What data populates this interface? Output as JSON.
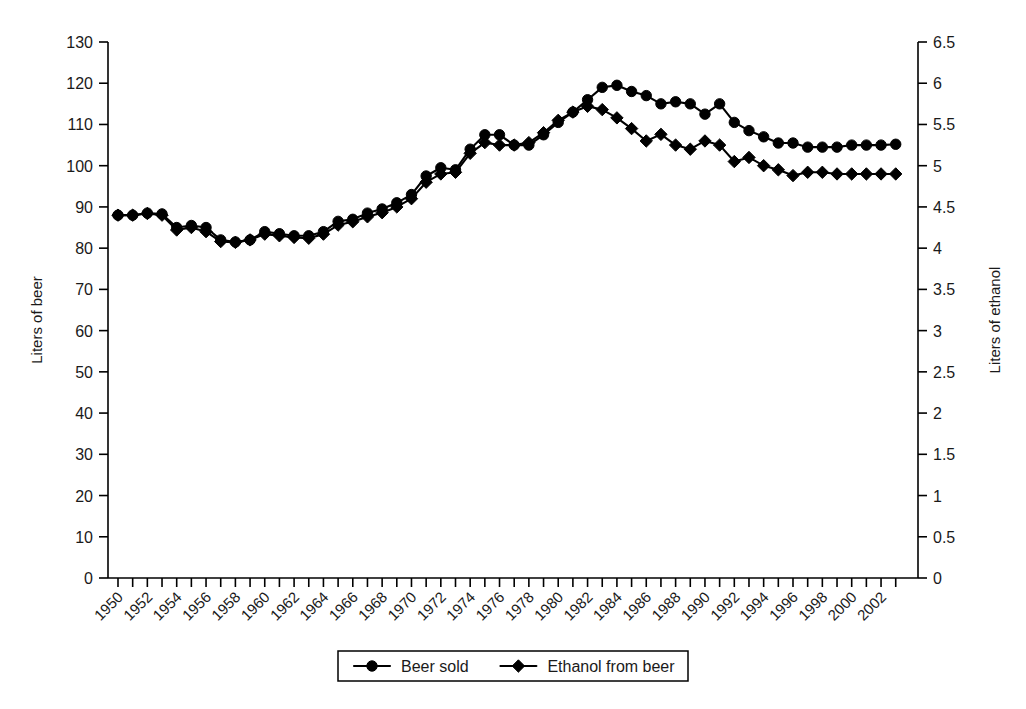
{
  "chart_data": {
    "type": "line",
    "title": "",
    "xlabel": "",
    "ylabel": "Liters of beer",
    "y2label": "Liters of ethanol",
    "ylim": [
      0,
      130
    ],
    "y2lim": [
      0,
      6.5
    ],
    "grid": false,
    "legend_position": "bottom",
    "x": [
      1950,
      1951,
      1952,
      1953,
      1954,
      1955,
      1956,
      1957,
      1958,
      1959,
      1960,
      1961,
      1962,
      1963,
      1964,
      1965,
      1966,
      1967,
      1968,
      1969,
      1970,
      1971,
      1972,
      1973,
      1974,
      1975,
      1976,
      1977,
      1978,
      1979,
      1980,
      1981,
      1982,
      1983,
      1984,
      1985,
      1986,
      1987,
      1988,
      1989,
      1990,
      1991,
      1992,
      1993,
      1994,
      1995,
      1996,
      1997,
      1998,
      1999,
      2000,
      2001,
      2002,
      2003
    ],
    "xtick_labels": [
      "1950",
      "1952",
      "1954",
      "1956",
      "1958",
      "1960",
      "1962",
      "1964",
      "1966",
      "1968",
      "1970",
      "1972",
      "1974",
      "1976",
      "1978",
      "1980",
      "1982",
      "1984",
      "1986",
      "1988",
      "1990",
      "1992",
      "1994",
      "1996",
      "1998",
      "2000",
      "2002"
    ],
    "ytick_labels": [
      "0",
      "10",
      "20",
      "30",
      "40",
      "50",
      "60",
      "70",
      "80",
      "90",
      "100",
      "110",
      "120",
      "130"
    ],
    "y2tick_labels": [
      "0",
      "0.5",
      "1",
      "1.5",
      "2",
      "2.5",
      "3",
      "3.5",
      "4",
      "4.5",
      "5",
      "5.5",
      "6",
      "6.5"
    ],
    "series": [
      {
        "name": "Beer sold",
        "marker": "circle",
        "axis": "left",
        "units": "liters of beer",
        "values": [
          88,
          88,
          88.5,
          88.3,
          85,
          85.5,
          85,
          82,
          81.5,
          82,
          84,
          83.5,
          83,
          83,
          84,
          86.5,
          87,
          88.5,
          89.5,
          91,
          93,
          97.5,
          99.5,
          99,
          104,
          107.5,
          107.5,
          105,
          105,
          107.5,
          110.5,
          113,
          116,
          119,
          119.5,
          118,
          117,
          115,
          115.5,
          115,
          112.5,
          115,
          110.5,
          108.5,
          107,
          105.5,
          105.5,
          104.5,
          104.5,
          104.5,
          105,
          105,
          105,
          105.2
        ],
        "values_right_axis": [
          4.4,
          4.4,
          4.43,
          4.42,
          4.25,
          4.28,
          4.25,
          4.1,
          4.08,
          4.1,
          4.2,
          4.18,
          4.15,
          4.15,
          4.2,
          4.33,
          4.35,
          4.43,
          4.48,
          4.55,
          4.65,
          4.88,
          4.98,
          4.95,
          5.2,
          5.38,
          5.38,
          5.25,
          5.25,
          5.38,
          5.53,
          5.65,
          5.8,
          5.95,
          5.98,
          5.9,
          5.85,
          5.75,
          5.78,
          5.75,
          5.63,
          5.75,
          5.53,
          5.43,
          5.35,
          5.28,
          5.28,
          5.23,
          5.23,
          5.23,
          5.25,
          5.25,
          5.25,
          5.26
        ]
      },
      {
        "name": "Ethanol from beer",
        "marker": "diamond",
        "axis": "right",
        "units": "liters of ethanol",
        "values": [
          4.4,
          4.4,
          4.42,
          4.4,
          4.22,
          4.25,
          4.2,
          4.08,
          4.07,
          4.1,
          4.17,
          4.15,
          4.13,
          4.12,
          4.17,
          4.28,
          4.32,
          4.38,
          4.43,
          4.5,
          4.6,
          4.8,
          4.9,
          4.92,
          5.15,
          5.28,
          5.25,
          5.25,
          5.28,
          5.4,
          5.55,
          5.65,
          5.72,
          5.68,
          5.58,
          5.45,
          5.3,
          5.38,
          5.25,
          5.2,
          5.3,
          5.25,
          5.05,
          5.1,
          5.0,
          4.95,
          4.88,
          4.92,
          4.92,
          4.9,
          4.9,
          4.9,
          4.9,
          4.9
        ],
        "values_left_scale": [
          88,
          88,
          88.4,
          88,
          84.4,
          85,
          84,
          81.6,
          81.4,
          82,
          83.4,
          83,
          82.6,
          82.4,
          83.4,
          85.6,
          86.4,
          87.6,
          88.6,
          90,
          92,
          96,
          98,
          98.4,
          103,
          105.6,
          105,
          105,
          105.6,
          108,
          111,
          113,
          114.4,
          113.6,
          111.6,
          109,
          106,
          107.6,
          105,
          104,
          106,
          105,
          101,
          102,
          100,
          99,
          97.6,
          98.4,
          98.4,
          98,
          98,
          98,
          98,
          98
        ]
      }
    ]
  },
  "legend": {
    "items": [
      {
        "label": "Beer sold",
        "marker": "circle"
      },
      {
        "label": "Ethanol from beer",
        "marker": "diamond"
      }
    ]
  },
  "axes": {
    "left_title": "Liters of beer",
    "right_title": "Liters of ethanol"
  }
}
